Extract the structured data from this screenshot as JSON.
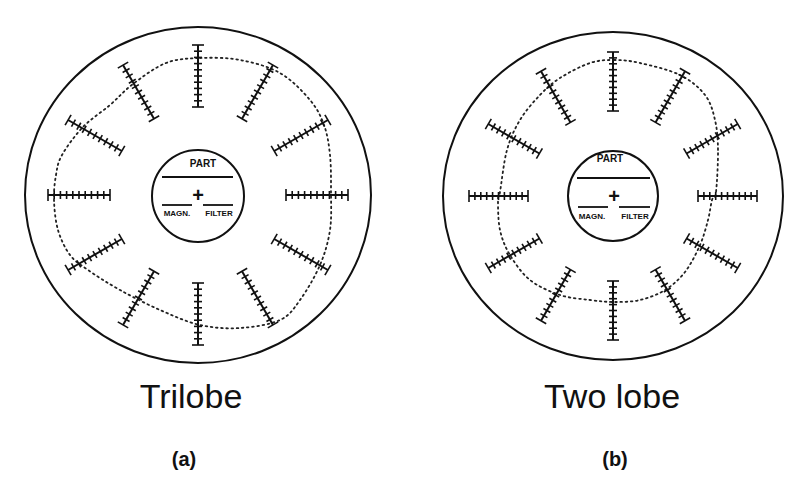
{
  "figure": {
    "panels": [
      {
        "id": "a",
        "title": "Trilobe",
        "sublabel": "(a)",
        "center": [
          198,
          195
        ],
        "outer_circle": {
          "rx": 173,
          "ry": 168
        },
        "inner_circle": {
          "r": 46
        },
        "inner_labels": {
          "top": "PART",
          "left": "MAGN.",
          "right": "FILTER",
          "center_mark": "+"
        },
        "scale_bars": {
          "count": 12,
          "angle_step_deg": 30,
          "inner_radius": 88,
          "outer_radius": 150,
          "ticks": 11
        },
        "profile_points": [
          [
            200,
            58
          ],
          [
            240,
            60
          ],
          [
            280,
            73
          ],
          [
            310,
            100
          ],
          [
            324,
            125
          ],
          [
            330,
            155
          ],
          [
            331,
            192
          ],
          [
            330,
            230
          ],
          [
            320,
            265
          ],
          [
            300,
            300
          ],
          [
            280,
            320
          ],
          [
            240,
            328
          ],
          [
            200,
            325
          ],
          [
            160,
            310
          ],
          [
            120,
            290
          ],
          [
            88,
            270
          ],
          [
            70,
            255
          ],
          [
            58,
            230
          ],
          [
            54,
            200
          ],
          [
            56,
            175
          ],
          [
            62,
            155
          ],
          [
            83,
            127
          ],
          [
            110,
            105
          ],
          [
            133,
            84
          ],
          [
            166,
            63
          ]
        ]
      },
      {
        "id": "b",
        "title": "Two lobe",
        "sublabel": "(b)",
        "center": [
          613,
          196
        ],
        "outer_circle": {
          "rx": 170,
          "ry": 164
        },
        "inner_circle": {
          "r": 45
        },
        "inner_labels": {
          "top": "PART",
          "left": "MAGN.",
          "right": "FILTER",
          "center_mark": "+"
        },
        "scale_bars": {
          "count": 12,
          "angle_step_deg": 30,
          "inner_radius": 85,
          "outer_radius": 144,
          "ticks": 11
        },
        "profile_points": [
          [
            614,
            60
          ],
          [
            640,
            63
          ],
          [
            680,
            75
          ],
          [
            705,
            95
          ],
          [
            715,
            120
          ],
          [
            718,
            150
          ],
          [
            716,
            192
          ],
          [
            712,
            200
          ],
          [
            708,
            220
          ],
          [
            700,
            245
          ],
          [
            685,
            272
          ],
          [
            665,
            290
          ],
          [
            640,
            300
          ],
          [
            614,
            302
          ],
          [
            590,
            300
          ],
          [
            560,
            295
          ],
          [
            530,
            280
          ],
          [
            510,
            255
          ],
          [
            500,
            230
          ],
          [
            498,
            200
          ],
          [
            500,
            192
          ],
          [
            507,
            150
          ],
          [
            520,
            120
          ],
          [
            540,
            95
          ],
          [
            560,
            78
          ],
          [
            590,
            63
          ]
        ]
      }
    ]
  }
}
